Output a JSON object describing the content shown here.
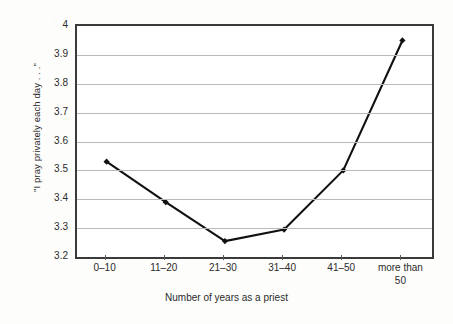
{
  "chart_data": {
    "type": "line",
    "title": "",
    "subtitle": "",
    "xlabel": "Number of years as a priest",
    "ylabel": "\"I pray privately each day . . .\"",
    "categories": [
      "0–10",
      "11–20",
      "21–30",
      "31–40",
      "41–50",
      "more than 50"
    ],
    "category_labels_wrapped": [
      [
        "0–10"
      ],
      [
        "11–20"
      ],
      [
        "21–30"
      ],
      [
        "31–40"
      ],
      [
        "41–50"
      ],
      [
        "more than",
        "50"
      ]
    ],
    "values": [
      3.53,
      3.39,
      3.255,
      3.295,
      3.5,
      3.95
    ],
    "ylim": [
      3.2,
      4.0
    ],
    "ytick_labels": [
      "4",
      "3.9",
      "3.8",
      "3.7",
      "3.6",
      "3.5",
      "3.4",
      "3.3",
      "3.2"
    ],
    "ytick_values": [
      4.0,
      3.9,
      3.8,
      3.7,
      3.6,
      3.5,
      3.4,
      3.3,
      3.2
    ],
    "ytick_step": 0.1,
    "grid": "horizontal",
    "legend": "none",
    "series": [
      {
        "name": "\"I pray privately each day . . .\"",
        "values": [
          3.53,
          3.39,
          3.255,
          3.295,
          3.5,
          3.95
        ],
        "line_color": "#111111",
        "marker_color": "#111111",
        "marker": "diamond"
      }
    ],
    "colors": {
      "line": "#111111",
      "marker": "#111111",
      "gridline": "#b9b9b9",
      "frame": "#3a3a3a",
      "text": "#2b2b2b",
      "background": "#ffffff"
    }
  }
}
